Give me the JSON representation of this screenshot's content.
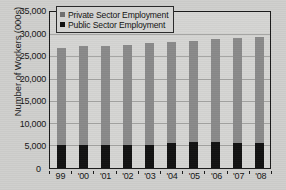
{
  "chart_data": {
    "type": "bar",
    "subtype": "stacked-bar",
    "title": "",
    "xlabel": "",
    "ylabel": "Number of Workers (000s)",
    "ylim": [
      0,
      35000
    ],
    "yticks": [
      "0",
      "5,000",
      "10,000",
      "15,000",
      "20,000",
      "25,000",
      "30,000",
      "35,000"
    ],
    "ytick_values": [
      0,
      5000,
      10000,
      15000,
      20000,
      25000,
      30000,
      35000
    ],
    "grid": true,
    "legend_position": "top-left",
    "categories": [
      "99",
      "'00",
      "'01",
      "'02",
      "'03",
      "'04",
      "'05",
      "'06",
      "'07",
      "'08"
    ],
    "series": [
      {
        "name": "Public Sector Employment",
        "color": "#121212",
        "values": [
          5100,
          5150,
          5250,
          5150,
          5300,
          5550,
          5800,
          5900,
          5600,
          5600
        ]
      },
      {
        "name": "Private Sector Employment",
        "color": "#8a8a8a",
        "values": [
          22000,
          22350,
          22400,
          22750,
          23000,
          22950,
          23000,
          23300,
          23800,
          24100
        ]
      }
    ],
    "totals": [
      27100,
      27500,
      27650,
      27900,
      28300,
      28500,
      28800,
      29200,
      29400,
      29700
    ]
  },
  "legend": {
    "items": [
      {
        "label": "Private Sector Employment",
        "swatch": "private-swatch"
      },
      {
        "label": "Public Sector Employment",
        "swatch": "public-swatch"
      }
    ]
  },
  "axes": {
    "y_title": "Number of Workers (000s)",
    "zero_label": "0"
  }
}
